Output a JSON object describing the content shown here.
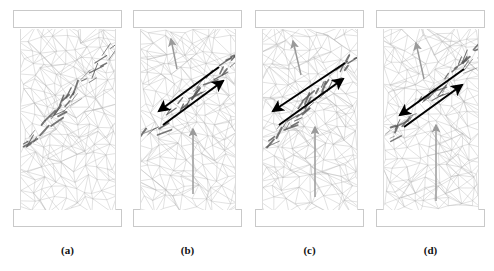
{
  "figure": {
    "caption_labels": [
      "(a)",
      "(b)",
      "(c)",
      "(d)"
    ],
    "panel_count": 4,
    "background_color": "#ffffff",
    "mesh_color": "#b4b4b4",
    "crack_color": "#555555",
    "shear_arrow_color": "#000000",
    "load_arrow_color": "#9a9a9a",
    "platen_fill": "#ffffff",
    "platen_border": "#c9c9c9",
    "specimen_border": "#dcdcdc"
  },
  "panels": [
    {
      "id": "a",
      "label": "(a)",
      "x": 13,
      "specimen_x": 20,
      "has_shear_arrows": false,
      "has_load_arrow": false,
      "has_crack_band": true,
      "seed": 11,
      "crack_band": {
        "x1": 4,
        "y1": 120,
        "x2": 98,
        "y2": 14,
        "width": 1.4
      },
      "description": "mesh specimen with incipient diagonal crack band, no annotation arrows"
    },
    {
      "id": "b",
      "label": "(b)",
      "x": 133,
      "specimen_x": 140,
      "has_shear_arrows": true,
      "has_load_arrow": true,
      "has_crack_band": true,
      "seed": 27,
      "crack_band": {
        "x1": 2,
        "y1": 112,
        "x2": 100,
        "y2": 22,
        "width": 1.4
      },
      "shear_arrows": [
        {
          "x1": 78,
          "y1": 38,
          "x2": 18,
          "y2": 82,
          "head": "end"
        },
        {
          "x1": 22,
          "y1": 96,
          "x2": 82,
          "y2": 52,
          "head": "end"
        }
      ],
      "load_arrows": [
        {
          "x1": 36,
          "y1": 40,
          "x2": 30,
          "y2": 10,
          "head": "end",
          "kind": "inclined"
        },
        {
          "x1": 52,
          "y1": 165,
          "x2": 52,
          "y2": 100,
          "head": "end",
          "kind": "vertical"
        }
      ],
      "description": "shear band with anti-parallel sliding arrows and upward load arrow"
    },
    {
      "id": "c",
      "label": "(c)",
      "x": 255,
      "specimen_x": 262,
      "has_shear_arrows": true,
      "has_load_arrow": true,
      "has_crack_band": true,
      "seed": 43,
      "crack_band": {
        "x1": 0,
        "y1": 118,
        "x2": 100,
        "y2": 20,
        "width": 1.5
      },
      "shear_arrows": [
        {
          "x1": 82,
          "y1": 34,
          "x2": 10,
          "y2": 82,
          "head": "end"
        },
        {
          "x1": 16,
          "y1": 96,
          "x2": 80,
          "y2": 50,
          "head": "end"
        }
      ],
      "load_arrows": [
        {
          "x1": 38,
          "y1": 46,
          "x2": 30,
          "y2": 12,
          "head": "end",
          "kind": "inclined"
        },
        {
          "x1": 52,
          "y1": 168,
          "x2": 52,
          "y2": 98,
          "head": "end",
          "kind": "vertical"
        }
      ],
      "description": "propagated shear band reaching specimen edge with sliding arrows"
    },
    {
      "id": "d",
      "label": "(d)",
      "x": 376,
      "specimen_x": 383,
      "has_shear_arrows": true,
      "has_load_arrow": true,
      "has_crack_band": true,
      "seed": 61,
      "crack_band": {
        "x1": 2,
        "y1": 110,
        "x2": 100,
        "y2": 18,
        "width": 1.4
      },
      "shear_arrows": [
        {
          "x1": 80,
          "y1": 40,
          "x2": 16,
          "y2": 86,
          "head": "end"
        },
        {
          "x1": 20,
          "y1": 98,
          "x2": 78,
          "y2": 56,
          "head": "end"
        }
      ],
      "load_arrows": [
        {
          "x1": 40,
          "y1": 50,
          "x2": 32,
          "y2": 14,
          "head": "end",
          "kind": "inclined"
        },
        {
          "x1": 52,
          "y1": 172,
          "x2": 52,
          "y2": 96,
          "head": "end",
          "kind": "vertical"
        }
      ],
      "description": "fully developed macroscopic shear failure plane with sliding arrows"
    }
  ],
  "geometry": {
    "platen_width": 109,
    "platen_height": 18,
    "platen_top_y": 10,
    "platen_bottom_y": 209,
    "specimen_width": 96,
    "specimen_top_y": 29,
    "specimen_height": 181,
    "label_y": 244
  }
}
